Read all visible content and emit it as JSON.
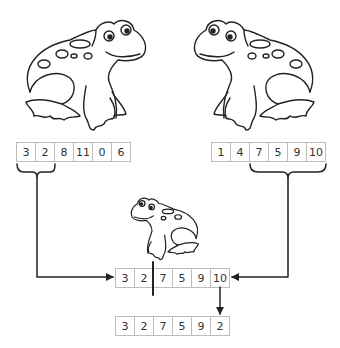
{
  "diagram": {
    "title": "",
    "colors": {
      "line": "#222222",
      "cell_border": "#bdbdbd",
      "text": "#333333"
    },
    "parent_left": {
      "icon": "frog-facing-right-icon",
      "values": [
        "3",
        "2",
        "8",
        "11",
        "0",
        "6"
      ],
      "selected_range": [
        0,
        1
      ]
    },
    "parent_right": {
      "icon": "frog-facing-left-icon",
      "values": [
        "1",
        "4",
        "7",
        "5",
        "9",
        "10"
      ],
      "selected_range": [
        2,
        5
      ]
    },
    "child": {
      "icon": "small-frog-icon",
      "values": [
        "3",
        "2",
        "7",
        "5",
        "9",
        "10"
      ],
      "crossover_after_index": 1
    },
    "mutated_child": {
      "values": [
        "3",
        "2",
        "7",
        "5",
        "9",
        "2"
      ],
      "mutated_index": 5
    }
  }
}
